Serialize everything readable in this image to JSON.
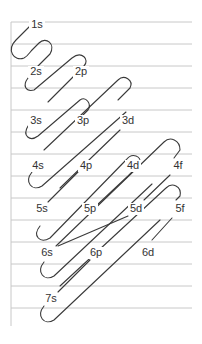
{
  "diagram": {
    "type": "aufbau-filling-order",
    "colors": {
      "line": "#3a3a3a",
      "grid": "#c8c8c8",
      "text": "#333333",
      "background": "#ffffff"
    },
    "orbitals": [
      {
        "label": "1s",
        "x": 37,
        "y": 25
      },
      {
        "label": "2s",
        "x": 36,
        "y": 72
      },
      {
        "label": "2p",
        "x": 81,
        "y": 72
      },
      {
        "label": "3s",
        "x": 36,
        "y": 121
      },
      {
        "label": "3p",
        "x": 83,
        "y": 121
      },
      {
        "label": "3d",
        "x": 128,
        "y": 121
      },
      {
        "label": "4s",
        "x": 38,
        "y": 166
      },
      {
        "label": "4p",
        "x": 86,
        "y": 166
      },
      {
        "label": "4d",
        "x": 133,
        "y": 166
      },
      {
        "label": "4f",
        "x": 178,
        "y": 166
      },
      {
        "label": "5s",
        "x": 42,
        "y": 209
      },
      {
        "label": "5p",
        "x": 90,
        "y": 209
      },
      {
        "label": "5d",
        "x": 136,
        "y": 209
      },
      {
        "label": "5f",
        "x": 180,
        "y": 209
      },
      {
        "label": "6s",
        "x": 47,
        "y": 253
      },
      {
        "label": "6p",
        "x": 96,
        "y": 253
      },
      {
        "label": "6d",
        "x": 148,
        "y": 253
      },
      {
        "label": "7s",
        "x": 51,
        "y": 299
      }
    ],
    "gridlines_y": [
      22,
      44,
      66,
      88,
      110,
      132,
      154,
      176,
      198,
      220,
      242,
      264,
      286,
      308
    ]
  }
}
